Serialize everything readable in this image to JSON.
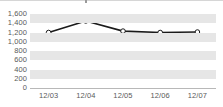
{
  "chart_data": {
    "type": "line",
    "title": "",
    "subtitle": "",
    "xlabel": "",
    "ylabel": "",
    "categories": [
      "12/03",
      "12/04",
      "12/05",
      "12/06",
      "12/07"
    ],
    "series": [
      {
        "name": "",
        "values": [
          1200,
          1450,
          1230,
          1200,
          1210
        ]
      }
    ],
    "ylim": [
      0,
      1600
    ],
    "ytick_labels": [
      "1,600",
      "1,400",
      "1,200",
      "1,000",
      "800",
      "600",
      "400",
      "200",
      "0"
    ],
    "ytick_values": [
      1600,
      1400,
      1200,
      1000,
      800,
      600,
      400,
      200,
      0
    ],
    "grid": true,
    "grid_style": "alternating-horizontal-bands",
    "legend": false,
    "legend_position": "none",
    "annotations": [],
    "colors": {
      "line": "#1a1a1a",
      "marker_fill": "#ffffff",
      "marker_stroke": "#1a1a1a",
      "band": "#e6e6e6",
      "plot_background": "#ffffff",
      "axis_line": "#b8b8b8",
      "tick_label": "#5a5a5a"
    }
  }
}
